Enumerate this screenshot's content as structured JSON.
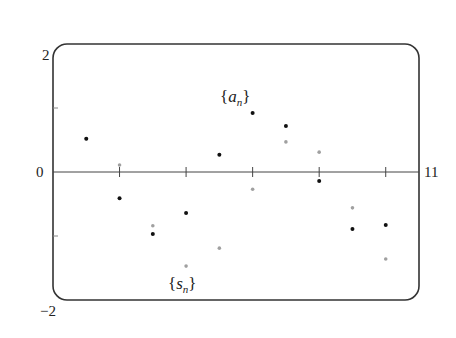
{
  "chart_data": {
    "type": "scatter",
    "title": "",
    "xlabel": "",
    "ylabel": "",
    "xlim": [
      0,
      11
    ],
    "ylim": [
      -2,
      2
    ],
    "grid": false,
    "legend": "inline labels",
    "axis_labels": {
      "y_top": "2",
      "y_zero": "0",
      "y_bottom": "−2",
      "x_right": "11"
    },
    "x_ticks": [
      2,
      4,
      6,
      8,
      10
    ],
    "y_ticks": [
      -1,
      1
    ],
    "series": [
      {
        "name": "{a_n}",
        "label_base": "a",
        "label_sub": "n",
        "color": "#111111",
        "x": [
          1,
          2,
          3,
          4,
          5,
          6,
          7,
          8,
          9,
          10
        ],
        "values": [
          0.52,
          -0.41,
          -0.97,
          -0.64,
          0.27,
          0.92,
          0.72,
          -0.14,
          -0.89,
          -0.83
        ]
      },
      {
        "name": "{s_n}",
        "label_base": "s",
        "label_sub": "n",
        "color": "#a0a0a0",
        "x": [
          1,
          2,
          3,
          4,
          5,
          6,
          7,
          8,
          9,
          10
        ],
        "values": [
          0.52,
          0.11,
          -0.84,
          -1.47,
          -1.19,
          -0.27,
          0.47,
          0.31,
          -0.56,
          -1.36
        ]
      }
    ]
  }
}
